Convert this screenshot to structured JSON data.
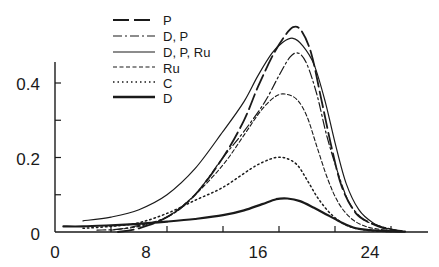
{
  "chart_data": {
    "type": "line",
    "title": "",
    "xlabel": "",
    "ylabel": "",
    "xlim": [
      0,
      26.5
    ],
    "ylim": [
      0,
      0.46
    ],
    "grid": false,
    "legend_position": "top-left (inside plot)",
    "x_ticks": [
      0,
      4,
      8,
      12,
      16,
      20,
      24
    ],
    "x_tick_labels": [
      "0",
      "8",
      "16",
      "24"
    ],
    "x_tick_label_values": [
      0,
      8,
      16,
      24
    ],
    "y_ticks": [
      0,
      0.1,
      0.2,
      0.3,
      0.4
    ],
    "y_tick_labels": [
      "0",
      "0.2",
      "0.4"
    ],
    "y_tick_label_values": [
      0,
      0.2,
      0.4
    ],
    "series": [
      {
        "name": "P",
        "style": "long-dash",
        "width": 1.8,
        "x": [
          4.5,
          6,
          8,
          10,
          12,
          13.5,
          14.5,
          15.5,
          16.3,
          17,
          17.6,
          18.3,
          19,
          19.8,
          20.5,
          21.5,
          22.5,
          23.5,
          24.5
        ],
        "y": [
          0.0,
          0.01,
          0.04,
          0.1,
          0.2,
          0.3,
          0.39,
          0.47,
          0.52,
          0.55,
          0.54,
          0.48,
          0.36,
          0.22,
          0.12,
          0.05,
          0.025,
          0.01,
          0.003
        ]
      },
      {
        "name": "D, P",
        "style": "dash-dot",
        "width": 1.2,
        "x": [
          3,
          5,
          8,
          10,
          12,
          13.5,
          15,
          16,
          16.8,
          17.4,
          18,
          18.7,
          19.4,
          20.2,
          21,
          22,
          23,
          24,
          24.8
        ],
        "y": [
          0.005,
          0.01,
          0.04,
          0.1,
          0.2,
          0.27,
          0.35,
          0.42,
          0.47,
          0.48,
          0.45,
          0.37,
          0.26,
          0.16,
          0.08,
          0.035,
          0.018,
          0.008,
          0.002
        ]
      },
      {
        "name": "D, P, Ru",
        "style": "solid",
        "width": 1.2,
        "x": [
          2,
          4,
          6,
          8,
          10,
          12,
          13.5,
          14.5,
          15.5,
          16.3,
          17,
          17.7,
          18.5,
          19.3,
          20,
          20.8,
          21.7,
          22.7,
          23.7,
          24.8
        ],
        "y": [
          0.03,
          0.04,
          0.06,
          0.1,
          0.17,
          0.27,
          0.35,
          0.42,
          0.48,
          0.51,
          0.52,
          0.5,
          0.45,
          0.35,
          0.24,
          0.13,
          0.06,
          0.025,
          0.01,
          0.003
        ]
      },
      {
        "name": "Ru",
        "style": "short-dash",
        "width": 1.1,
        "x": [
          4,
          6,
          8,
          10,
          12,
          13.5,
          14.8,
          15.8,
          16.5,
          17.3,
          18,
          18.7,
          19.5,
          20.3,
          21.2,
          22.2,
          23.2,
          24.2
        ],
        "y": [
          0.005,
          0.015,
          0.04,
          0.1,
          0.18,
          0.26,
          0.33,
          0.365,
          0.37,
          0.355,
          0.31,
          0.23,
          0.14,
          0.075,
          0.035,
          0.015,
          0.007,
          0.002
        ]
      },
      {
        "name": "C",
        "style": "dotted",
        "width": 1.5,
        "x": [
          2,
          4,
          6,
          8,
          10,
          12,
          14,
          15,
          15.8,
          16.5,
          17.3,
          18,
          18.8,
          19.8,
          21,
          22.5,
          24
        ],
        "y": [
          0.01,
          0.015,
          0.025,
          0.05,
          0.085,
          0.12,
          0.17,
          0.19,
          0.2,
          0.198,
          0.18,
          0.14,
          0.09,
          0.045,
          0.015,
          0.004,
          0.001
        ]
      },
      {
        "name": "D",
        "style": "solid-thick",
        "width": 2.2,
        "x": [
          0.6,
          2,
          4,
          6,
          8,
          10,
          12,
          13.5,
          14.8,
          15.8,
          16.6,
          17.5,
          18.5,
          19.5,
          20.5,
          21.5,
          22.5,
          24,
          25
        ],
        "y": [
          0.015,
          0.015,
          0.018,
          0.022,
          0.028,
          0.035,
          0.045,
          0.058,
          0.075,
          0.088,
          0.09,
          0.083,
          0.065,
          0.045,
          0.025,
          0.01,
          0.005,
          0.002,
          0.001
        ]
      }
    ]
  },
  "legend": {
    "items": [
      {
        "label": "P"
      },
      {
        "label": "D, P"
      },
      {
        "label": "D, P, Ru"
      },
      {
        "label": "Ru"
      },
      {
        "label": "C"
      },
      {
        "label": "D"
      }
    ]
  },
  "axes": {
    "x_labels": [
      "0",
      "8",
      "16",
      "24"
    ],
    "y_labels": [
      "0",
      "0.2",
      "0.4"
    ]
  }
}
